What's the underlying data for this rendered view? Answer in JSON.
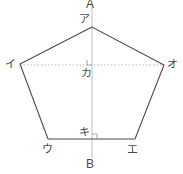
{
  "figure": {
    "type": "geometry-diagram",
    "background_color": "#ffffff",
    "canvas": {
      "width": 183,
      "height": 174
    },
    "styles": {
      "polygon_stroke": "#4a4a4a",
      "polygon_fill": "none",
      "polygon_stroke_width": 1.1,
      "axis_stroke": "#c9c9c9",
      "axis_stroke_width": 1.2,
      "dotted_stroke": "#b8b8b8",
      "dotted_stroke_width": 1,
      "dotted_dash": "1.5 2",
      "right_angle_stroke": "#9a9a9a",
      "label_color": "#4a4a4a"
    },
    "axis_line": {
      "name": "vertical-symmetry-axis",
      "x": 92,
      "y1": 4,
      "y2": 158,
      "top_label": "A",
      "bottom_label": "B"
    },
    "dotted_line": {
      "name": "horizontal-diagonal",
      "x1": 20,
      "x2": 164,
      "y": 65
    },
    "polygon": {
      "name": "pentagon",
      "points": "92,27 20,64 48,139 135,139 164,65"
    },
    "vertices": [
      {
        "key": "a",
        "label": "ア",
        "px": 92,
        "py": 27,
        "lx": 79,
        "ly": 14
      },
      {
        "key": "i",
        "label": "イ",
        "px": 20,
        "py": 64,
        "lx": 5,
        "ly": 59
      },
      {
        "key": "u",
        "label": "ウ",
        "px": 48,
        "py": 139,
        "lx": 42,
        "ly": 145
      },
      {
        "key": "e",
        "label": "エ",
        "px": 135,
        "py": 139,
        "lx": 128,
        "ly": 145
      },
      {
        "key": "o",
        "label": "オ",
        "px": 164,
        "py": 65,
        "lx": 167,
        "ly": 59
      }
    ],
    "interior_points": [
      {
        "key": "ka",
        "label": "カ",
        "px": 92,
        "py": 65,
        "lx": 81,
        "ly": 68
      },
      {
        "key": "ki",
        "label": "キ",
        "px": 92,
        "py": 139,
        "lx": 79,
        "ly": 128
      }
    ],
    "right_angle_marks": [
      {
        "name": "right-angle-at-ka",
        "x": 87,
        "y": 59,
        "size": 5
      },
      {
        "name": "right-angle-at-ki",
        "x": 92,
        "y": 133,
        "size": 5
      }
    ],
    "axis_labels": {
      "top": "A",
      "bottom": "B",
      "top_pos": {
        "x": 86,
        "y": -1
      },
      "bottom_pos": {
        "x": 86,
        "y": 159
      }
    }
  }
}
